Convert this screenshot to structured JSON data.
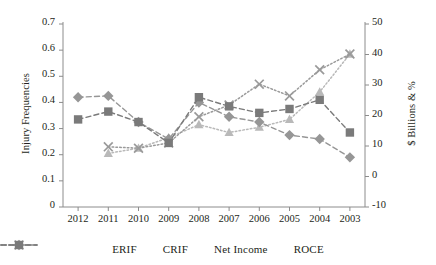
{
  "chart_data": {
    "type": "line",
    "title": "",
    "xlabel": "",
    "ylabel": "Injury Frequencies",
    "y2label": "$ Billions & %",
    "categories": [
      "2012",
      "2011",
      "2010",
      "2009",
      "2008",
      "2007",
      "2006",
      "2005",
      "2004",
      "2003"
    ],
    "ylim": [
      0,
      0.7
    ],
    "yticks": [
      "0",
      "0.1",
      "0.2",
      "0.3",
      "0.4",
      "0.5",
      "0.6",
      "0.7"
    ],
    "ytick_values": [
      0,
      0.1,
      0.2,
      0.3,
      0.4,
      0.5,
      0.6,
      0.7
    ],
    "y2lim": [
      -10,
      50
    ],
    "y2ticks": [
      "-10",
      "0",
      "10",
      "20",
      "30",
      "40",
      "50"
    ],
    "y2tick_values": [
      -10,
      0,
      10,
      20,
      30,
      40,
      50
    ],
    "grid": false,
    "legend_position": "bottom",
    "series": [
      {
        "name": "ERIF",
        "axis": "left",
        "marker": "triangle",
        "linestyle": "dotted",
        "color": "#b9b9b9",
        "values": [
          null,
          0.205,
          0.225,
          0.265,
          0.315,
          0.285,
          0.305,
          0.335,
          0.44,
          0.585
        ]
      },
      {
        "name": "CRIF",
        "axis": "left",
        "marker": "x",
        "linestyle": "dotted",
        "color": "#9a9a9a",
        "values": [
          null,
          0.23,
          0.225,
          0.245,
          0.345,
          0.39,
          0.47,
          0.425,
          0.525,
          0.585
        ]
      },
      {
        "name": "Net Income",
        "axis": "left",
        "marker": "diamond",
        "linestyle": "dashed",
        "color": "#969696",
        "values": [
          0.42,
          0.425,
          0.325,
          0.26,
          0.4,
          0.345,
          0.325,
          0.275,
          0.26,
          0.19
        ]
      },
      {
        "name": "ROCE",
        "axis": "left",
        "marker": "square",
        "linestyle": "dashed",
        "color": "#7a7a7a",
        "values": [
          0.335,
          0.365,
          0.325,
          0.245,
          0.42,
          0.385,
          0.36,
          0.375,
          0.41,
          0.285
        ]
      }
    ]
  },
  "legend": {
    "items": [
      {
        "label": "ERIF"
      },
      {
        "label": "CRIF"
      },
      {
        "label": "Net Income"
      },
      {
        "label": "ROCE"
      }
    ]
  },
  "colors": {
    "axis": "#8c8c8c",
    "text": "#231f20",
    "erif": "#b9b9b9",
    "crif": "#9a9a9a",
    "net_income": "#969696",
    "roce": "#7a7a7a"
  }
}
